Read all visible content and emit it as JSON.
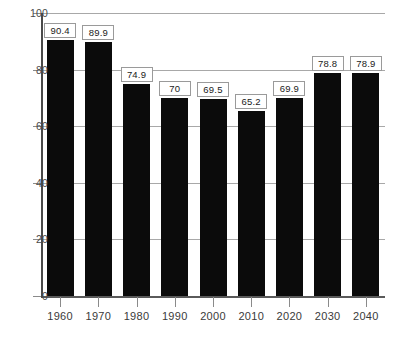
{
  "chart_data": {
    "type": "bar",
    "title": "",
    "subtitle": "",
    "xlabel": "",
    "ylabel": "",
    "categories": [
      "1960",
      "1970",
      "1980",
      "1990",
      "2000",
      "2010",
      "2020",
      "2030",
      "2040"
    ],
    "values": [
      90.4,
      89.9,
      74.9,
      70,
      69.5,
      65.2,
      69.9,
      78.8,
      78.9
    ],
    "value_labels": [
      "90.4",
      "89.9",
      "74.9",
      "70",
      "69.5",
      "65.2",
      "69.9",
      "78.8",
      "78.9"
    ],
    "ylim": [
      0,
      100
    ],
    "yticks": [
      0,
      20,
      40,
      60,
      80,
      100
    ],
    "ytick_labels": [
      "0",
      "20",
      "40",
      "60",
      "80",
      "100"
    ],
    "grid": true,
    "grid_axis": "y",
    "legend": null,
    "legend_position": "none",
    "series": [
      {
        "name": "series-1",
        "values": [
          90.4,
          89.9,
          74.9,
          70,
          69.5,
          65.2,
          69.9,
          78.8,
          78.9
        ]
      }
    ]
  },
  "style": {
    "bar_color": "#0b0b0b",
    "grid_color": "#a8a8a8",
    "axis_color": "#4a4a4a",
    "label_box_background": "#ffffff",
    "label_box_border": "#9a9a9a",
    "text_color": "#3a3a3a",
    "background": "#ffffff"
  }
}
